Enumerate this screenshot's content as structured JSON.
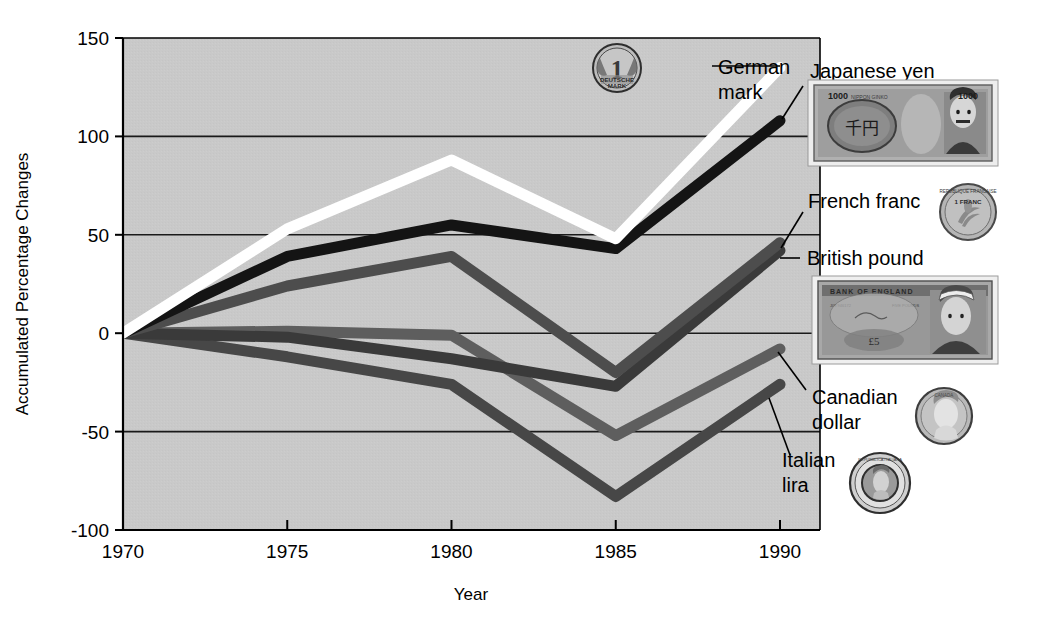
{
  "chart_data": {
    "type": "line",
    "title": "",
    "xlabel": "Year",
    "ylabel": "Accumulated Percentage Changes",
    "x": [
      1970,
      1975,
      1980,
      1985,
      1990
    ],
    "xticklabels": [
      "1970",
      "1975",
      "1980",
      "1985",
      "1990"
    ],
    "yticklabels": [
      "150",
      "100",
      "50",
      "0",
      "-50",
      "-100"
    ],
    "yticks": [
      150,
      100,
      50,
      0,
      -50,
      -100
    ],
    "xlim": [
      1970,
      1990
    ],
    "ylim": [
      -100,
      150
    ],
    "grid": "horizontal",
    "legend_position": "right-inline-annotations",
    "plot_background": "#c9c9c9",
    "series": [
      {
        "name": "German mark",
        "color": "#ffffff",
        "values": [
          0,
          53,
          88,
          48,
          135
        ]
      },
      {
        "name": "Japanese yen",
        "color": "#141414",
        "values": [
          0,
          39,
          55,
          43,
          108
        ]
      },
      {
        "name": "French franc",
        "color": "#4d4d4d",
        "values": [
          0,
          24,
          39,
          -20,
          46
        ]
      },
      {
        "name": "British pound",
        "color": "#3a3a3a",
        "values": [
          0,
          -2,
          -13,
          -27,
          42
        ]
      },
      {
        "name": "Canadian dollar",
        "color": "#5e5e5e",
        "values": [
          0,
          1,
          -1,
          -52,
          -8
        ]
      },
      {
        "name": "Italian lira",
        "color": "#474747",
        "values": [
          0,
          -12,
          -26,
          -83,
          -26
        ]
      }
    ]
  },
  "annotations": {
    "german_mark": {
      "label": "German\nmark",
      "line1": "German",
      "line2": "mark"
    },
    "japanese_yen": {
      "label": "Japanese yen"
    },
    "french_franc": {
      "label": "French franc"
    },
    "british_pound": {
      "label": "British pound"
    },
    "canadian_dollar": {
      "line1": "Canadian",
      "line2": "dollar"
    },
    "italian_lira": {
      "line1": "Italian",
      "line2": "lira"
    }
  },
  "icons": {
    "german_mark_coin": {
      "name": "german-mark-coin-icon",
      "denomination": "1",
      "text_line1": "DEUTSCHE",
      "text_line2": "MARK",
      "text_line3": "1991"
    },
    "japanese_yen_note": {
      "name": "japanese-yen-banknote-icon",
      "denomination_left": "1000",
      "denomination_right": "1000",
      "kanji": "千円",
      "bank_text": "NIPPON GINKO"
    },
    "french_franc_coin": {
      "name": "french-franc-coin-icon",
      "text_top": "REPUBLIQUE FRANCAISE",
      "denomination": "1 FRANC"
    },
    "british_pound_note": {
      "name": "british-pound-banknote-icon",
      "bank_text": "BANK OF ENGLAND",
      "promise_text": "FIVE POUNDS",
      "serial_left": "J08 946172",
      "serial_right": "J08 946172",
      "denomination": "£5"
    },
    "canadian_dollar_coin": {
      "name": "canadian-dollar-coin-icon",
      "text": "CANADA"
    },
    "italian_lira_coin": {
      "name": "italian-lira-coin-icon",
      "text": "REPUBBLICA ITALIANA"
    }
  },
  "colors": {
    "plot_bg": "#c9c9c9",
    "page_bg": "#ffffff",
    "gridline": "#1a1a1a",
    "axis": "#000000",
    "text": "#000000"
  }
}
